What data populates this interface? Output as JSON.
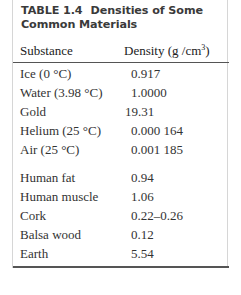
{
  "table": {
    "label": "TABLE 1.4",
    "title_line1": "Densities of Some",
    "title_line2": "Common Materials",
    "columns": {
      "substance": "Substance",
      "density": "Density (g /cm",
      "density_exp": "3",
      "density_close": ")"
    },
    "group1": [
      {
        "substance": "Ice (0 °C)",
        "density": "0.917"
      },
      {
        "substance": "Water (3.98 °C)",
        "density": "1.0000"
      },
      {
        "substance": "Gold",
        "density": "19.31"
      },
      {
        "substance": "Helium (25 °C)",
        "density": "0.000 164"
      },
      {
        "substance": "Air (25 °C)",
        "density": "0.001 185"
      }
    ],
    "group2": [
      {
        "substance": "Human fat",
        "density": "0.94"
      },
      {
        "substance": "Human muscle",
        "density": "1.06"
      },
      {
        "substance": "Cork",
        "density": "0.22–0.26"
      },
      {
        "substance": "Balsa wood",
        "density": "0.12"
      },
      {
        "substance": "Earth",
        "density": "5.54"
      }
    ]
  }
}
